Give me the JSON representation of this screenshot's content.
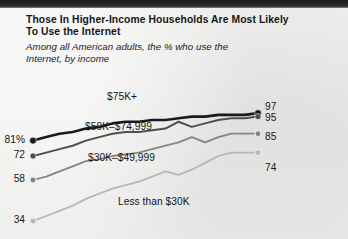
{
  "header": {
    "title_line1": "Those In Higher-Income Households Are Most Likely",
    "title_line2": "To Use the Internet",
    "subtitle_line1": "Among all American adults, the % who use the",
    "subtitle_line2": "Internet, by income"
  },
  "colors": {
    "background": "#ececea",
    "top_band": "#1d1d1d",
    "series_75k": "#1a1a1a",
    "series_50k": "#4f4f4f",
    "series_30k": "#858585",
    "series_under30k": "#b7b7b7",
    "text": "#151515"
  },
  "chart_data": {
    "type": "line",
    "title": "Those In Higher-Income Households Are Most Likely To Use the Internet",
    "subtitle": "Among all American adults, the % who use the Internet, by income",
    "xlabel": "",
    "ylabel": "",
    "ylim": [
      30,
      100
    ],
    "grid": false,
    "legend": "inline-labels",
    "x": [
      0,
      1,
      2,
      3,
      4,
      5,
      6,
      7,
      8,
      9,
      10,
      11,
      12,
      13,
      14,
      15,
      16,
      17
    ],
    "series": [
      {
        "name": "$75K+",
        "color": "#1a1a1a",
        "start_label": "81%",
        "end_label": "97",
        "values": [
          81,
          83,
          85,
          86,
          88,
          89,
          91,
          92,
          92,
          93,
          93,
          94,
          95,
          95,
          96,
          96,
          96,
          97
        ]
      },
      {
        "name": "$50K–$74,999",
        "color": "#4f4f4f",
        "start_label": "72",
        "end_label": "95",
        "values": [
          72,
          74,
          76,
          78,
          81,
          83,
          85,
          86,
          86,
          87,
          88,
          92,
          89,
          91,
          93,
          94,
          94,
          95
        ]
      },
      {
        "name": "$30K–$49,999",
        "color": "#858585",
        "start_label": "58",
        "end_label": "85",
        "values": [
          58,
          60,
          63,
          66,
          69,
          70,
          72,
          73,
          74,
          76,
          78,
          80,
          83,
          80,
          83,
          85,
          85,
          85
        ]
      },
      {
        "name": "Less than $30K",
        "color": "#b7b7b7",
        "start_label": "34",
        "end_label": "74",
        "values": [
          34,
          37,
          40,
          43,
          47,
          50,
          53,
          55,
          57,
          60,
          63,
          61,
          64,
          68,
          72,
          74,
          74,
          74
        ]
      }
    ],
    "start_labels": [
      "81%",
      "72",
      "58",
      "34"
    ],
    "end_labels": [
      "97",
      "95",
      "85",
      "74"
    ],
    "inline_labels": [
      "$75K+",
      "$50K–$74,999",
      "$30K–$49,999",
      "Less than $30K"
    ]
  }
}
